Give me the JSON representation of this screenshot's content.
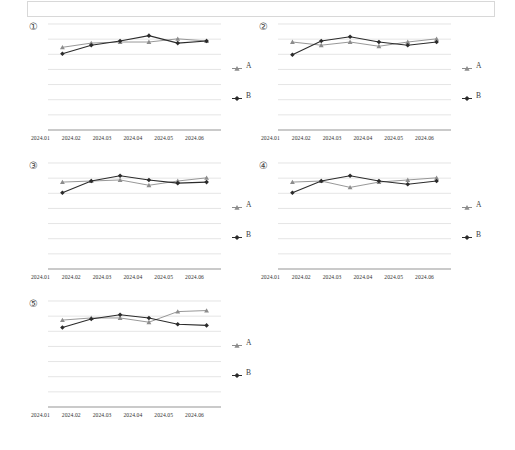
{
  "page": {
    "title": "",
    "top_box_text": ""
  },
  "legend_labels": {
    "a": "A",
    "b": "B"
  },
  "series_colors": {
    "a": "#8c8c8c",
    "b": "#2b2b2b"
  },
  "gridline_color": "#d9d9d9",
  "axis_color": "#9a9a9a",
  "chart_data": [
    {
      "id": "chart-1",
      "panel_number": "①",
      "type": "line",
      "title": "",
      "xlabel": "",
      "ylabel": "",
      "grid": true,
      "gridlines": 8,
      "legend_position": "right",
      "categories": [
        "2024.01",
        "2024.02",
        "2024.03",
        "2024.04",
        "2024.05",
        "2024.06"
      ],
      "ylim": [
        0,
        100
      ],
      "series": [
        {
          "name": "A",
          "marker": "triangle",
          "values": [
            78,
            82,
            83,
            83,
            86,
            84
          ]
        },
        {
          "name": "B",
          "marker": "diamond",
          "values": [
            72,
            80,
            84,
            89,
            82,
            84
          ]
        }
      ]
    },
    {
      "id": "chart-2",
      "panel_number": "②",
      "type": "line",
      "title": "",
      "xlabel": "",
      "ylabel": "",
      "grid": true,
      "gridlines": 8,
      "legend_position": "right",
      "categories": [
        "2024.01",
        "2024.02",
        "2024.03",
        "2024.04",
        "2024.05",
        "2024.06"
      ],
      "ylim": [
        0,
        100
      ],
      "series": [
        {
          "name": "A",
          "marker": "triangle",
          "values": [
            83,
            80,
            83,
            79,
            83,
            86
          ]
        },
        {
          "name": "B",
          "marker": "diamond",
          "values": [
            71,
            84,
            88,
            83,
            80,
            83
          ]
        }
      ]
    },
    {
      "id": "chart-3",
      "panel_number": "③",
      "type": "line",
      "title": "",
      "xlabel": "",
      "ylabel": "",
      "grid": true,
      "gridlines": 8,
      "legend_position": "right",
      "categories": [
        "2024.01",
        "2024.02",
        "2024.03",
        "2024.04",
        "2024.05",
        "2024.06"
      ],
      "ylim": [
        0,
        100
      ],
      "series": [
        {
          "name": "A",
          "marker": "triangle",
          "values": [
            82,
            83,
            84,
            79,
            83,
            86
          ]
        },
        {
          "name": "B",
          "marker": "diamond",
          "values": [
            72,
            83,
            88,
            84,
            81,
            82
          ]
        }
      ]
    },
    {
      "id": "chart-4",
      "panel_number": "④",
      "type": "line",
      "title": "",
      "xlabel": "",
      "ylabel": "",
      "grid": true,
      "gridlines": 8,
      "legend_position": "right",
      "categories": [
        "2024.01",
        "2024.02",
        "2024.03",
        "2024.04",
        "2024.05",
        "2024.06"
      ],
      "ylim": [
        0,
        100
      ],
      "series": [
        {
          "name": "A",
          "marker": "triangle",
          "values": [
            82,
            83,
            77,
            82,
            84,
            86
          ]
        },
        {
          "name": "B",
          "marker": "diamond",
          "values": [
            72,
            83,
            88,
            83,
            80,
            83
          ]
        }
      ]
    },
    {
      "id": "chart-5",
      "panel_number": "⑤",
      "type": "line",
      "title": "",
      "xlabel": "",
      "ylabel": "",
      "grid": true,
      "gridlines": 8,
      "legend_position": "right",
      "categories": [
        "2024.01",
        "2024.02",
        "2024.03",
        "2024.04",
        "2024.05",
        "2024.06"
      ],
      "ylim": [
        0,
        100
      ],
      "series": [
        {
          "name": "A",
          "marker": "triangle",
          "values": [
            82,
            84,
            84,
            80,
            90,
            91
          ]
        },
        {
          "name": "B",
          "marker": "diamond",
          "values": [
            75,
            83,
            87,
            84,
            78,
            77
          ]
        }
      ]
    }
  ]
}
